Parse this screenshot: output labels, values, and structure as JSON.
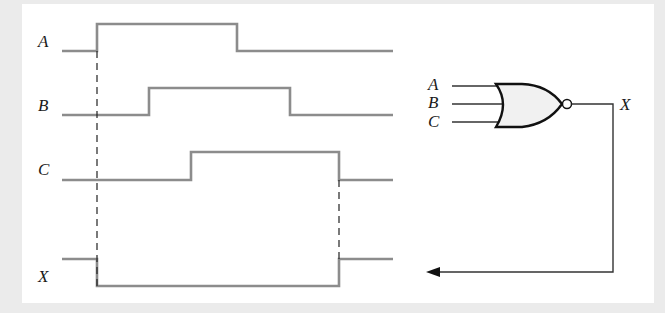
{
  "diagram": {
    "type": "timing-diagram-with-logic-gate",
    "timing": {
      "signals": [
        {
          "name": "A",
          "label": "A",
          "edges": [
            {
              "t": 97,
              "to": 1
            },
            {
              "t": 237,
              "to": 0
            }
          ],
          "initial": 0
        },
        {
          "name": "B",
          "label": "B",
          "edges": [
            {
              "t": 149,
              "to": 1
            },
            {
              "t": 290,
              "to": 0
            }
          ],
          "initial": 0
        },
        {
          "name": "C",
          "label": "C",
          "edges": [
            {
              "t": 191,
              "to": 1
            },
            {
              "t": 339,
              "to": 0
            }
          ],
          "initial": 0
        },
        {
          "name": "X",
          "label": "X",
          "edges": [
            {
              "t": 97,
              "to": 0
            },
            {
              "t": 339,
              "to": 1
            }
          ],
          "initial": 1
        }
      ],
      "time_range": [
        62,
        393
      ],
      "dashed_markers": [
        97,
        339
      ]
    },
    "gate": {
      "type": "NOR",
      "inputs": [
        "A",
        "B",
        "C"
      ],
      "output": "X",
      "output_feeds_back_to": "X waveform"
    }
  }
}
